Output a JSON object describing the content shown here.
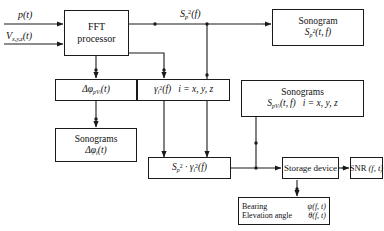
{
  "diagram": {
    "background_color": "#ffffff",
    "line_color": "#1a1a1a",
    "text_color": "#111111"
  },
  "inputs": [
    {
      "id": "input-pressure",
      "label": "p(t)"
    },
    {
      "id": "input-velocity",
      "label": "Vx,y,z(t)"
    }
  ],
  "signal_labels": [
    {
      "id": "signal-sp2f",
      "label": "Sp²(f)"
    }
  ],
  "blocks": {
    "fft_processor": {
      "line1": "FFT",
      "line2": "processor"
    },
    "sonogram_sp2": {
      "line1": "Sonogram",
      "line2": "Sp²(t, f)"
    },
    "delta_phi_pv": {
      "line1": "ΔφpVi(t)"
    },
    "sonograms_delta_phi": {
      "line1": "Sonograms",
      "line2": "Δφi(t)"
    },
    "gamma_sq": {
      "line1": "γi²(f)",
      "index": "i = x, y, z"
    },
    "sonograms_spv": {
      "line1": "Sonograms",
      "line2": "SpVi(t, f)",
      "index": "i = x, y, z"
    },
    "sp2_gamma": {
      "line1": "Sp² · γi²(f)"
    },
    "storage_device": {
      "line1": "Storage device"
    },
    "snr": {
      "line1": "SNR (f, t)"
    },
    "bearing": {
      "line1_left": "Bearing",
      "line1_right": "ψ(f, t)",
      "line2_left": "Elevation angle",
      "line2_right": "θ(f, t)"
    }
  }
}
